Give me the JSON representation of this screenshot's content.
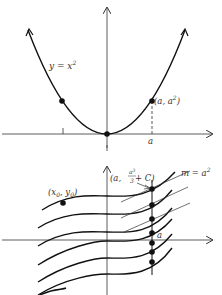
{
  "top_graph": {
    "curve_label": "y = x",
    "curve_label_exp": "2",
    "point_label": "(a, a",
    "point_label_exp": "2",
    "point_label_close": ")",
    "x_tick_label": "a"
  },
  "bottom_graph": {
    "start_point_label": "(x",
    "start_point_sub0": "0",
    "start_point_mid": ", y",
    "start_point_sub1": "0",
    "start_point_close": ")",
    "top_point_label_open": "(a, ",
    "top_point_frac_num": "a",
    "top_point_frac_num_exp": "3",
    "top_point_frac_den": "3",
    "top_point_label_tail": " + C)",
    "slope_label": "m = a",
    "slope_label_exp": "2",
    "x_tick_label": "a"
  },
  "colors": {
    "ink": "#111111",
    "axis": "#333333"
  }
}
